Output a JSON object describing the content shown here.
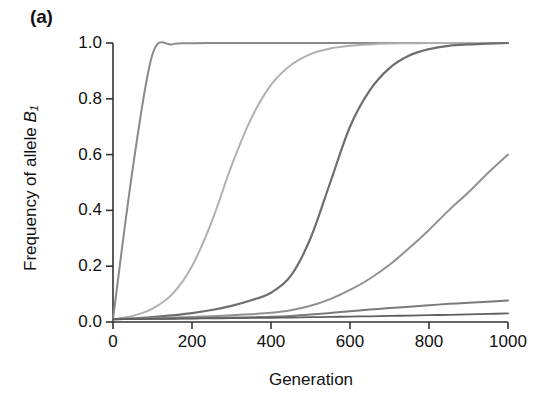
{
  "figure": {
    "panel_label": "(a)",
    "background_color": "#ffffff",
    "axis_color": "#333333"
  },
  "chart_data": {
    "type": "line",
    "title": "",
    "subtitle": "",
    "panel": "(a)",
    "xlabel": "Generation",
    "ylabel": "Frequency of allele B1",
    "ylabel_display": "Frequency of allele B₁",
    "xlim": [
      0,
      1000
    ],
    "ylim": [
      0.0,
      1.0
    ],
    "xticks": [
      0,
      200,
      400,
      600,
      800,
      1000
    ],
    "xtick_labels": [
      "0",
      "200",
      "400",
      "600",
      "800",
      "1000"
    ],
    "yticks": [
      0.0,
      0.2,
      0.4,
      0.6,
      0.8,
      1.0
    ],
    "ytick_labels": [
      "0.0",
      "0.2",
      "0.4",
      "0.6",
      "0.8",
      "1.0"
    ],
    "grid": false,
    "legend": false,
    "legend_position": "none",
    "x": [
      0,
      50,
      100,
      150,
      200,
      250,
      300,
      350,
      400,
      450,
      500,
      550,
      600,
      650,
      700,
      750,
      800,
      850,
      900,
      950,
      1000
    ],
    "series": [
      {
        "name": "curve-1",
        "color": "#8a8a8a",
        "linewidth": 2.0,
        "values": [
          0.01,
          0.55,
          0.96,
          0.995,
          0.999,
          1.0,
          1.0,
          1.0,
          1.0,
          1.0,
          1.0,
          1.0,
          1.0,
          1.0,
          1.0,
          1.0,
          1.0,
          1.0,
          1.0,
          1.0,
          1.0
        ]
      },
      {
        "name": "curve-2",
        "color": "#b0b0b0",
        "linewidth": 2.0,
        "values": [
          0.01,
          0.022,
          0.048,
          0.1,
          0.2,
          0.36,
          0.56,
          0.73,
          0.85,
          0.92,
          0.96,
          0.98,
          0.99,
          0.995,
          0.998,
          0.999,
          1.0,
          1.0,
          1.0,
          1.0,
          1.0
        ]
      },
      {
        "name": "curve-3",
        "color": "#6e6e6e",
        "linewidth": 2.2,
        "values": [
          0.01,
          0.013,
          0.018,
          0.024,
          0.032,
          0.043,
          0.058,
          0.078,
          0.105,
          0.165,
          0.3,
          0.5,
          0.7,
          0.83,
          0.91,
          0.955,
          0.978,
          0.99,
          0.995,
          0.998,
          1.0
        ]
      },
      {
        "name": "curve-4",
        "color": "#909090",
        "linewidth": 2.0,
        "values": [
          0.01,
          0.0115,
          0.0135,
          0.0155,
          0.018,
          0.021,
          0.024,
          0.028,
          0.033,
          0.042,
          0.058,
          0.082,
          0.115,
          0.155,
          0.205,
          0.265,
          0.33,
          0.4,
          0.465,
          0.535,
          0.6
        ]
      },
      {
        "name": "curve-5",
        "color": "#7a7a7a",
        "linewidth": 2.0,
        "values": [
          0.01,
          0.0108,
          0.0116,
          0.0125,
          0.0135,
          0.0146,
          0.0158,
          0.0171,
          0.0185,
          0.0215,
          0.0265,
          0.0325,
          0.0385,
          0.0445,
          0.05,
          0.055,
          0.06,
          0.065,
          0.069,
          0.073,
          0.077
        ]
      },
      {
        "name": "curve-6",
        "color": "#5f5f5f",
        "linewidth": 1.8,
        "values": [
          0.01,
          0.0105,
          0.0111,
          0.0117,
          0.0123,
          0.013,
          0.0137,
          0.0145,
          0.0153,
          0.0162,
          0.0172,
          0.0182,
          0.0193,
          0.0205,
          0.0217,
          0.023,
          0.0244,
          0.0258,
          0.0273,
          0.0289,
          0.0306
        ]
      }
    ]
  }
}
